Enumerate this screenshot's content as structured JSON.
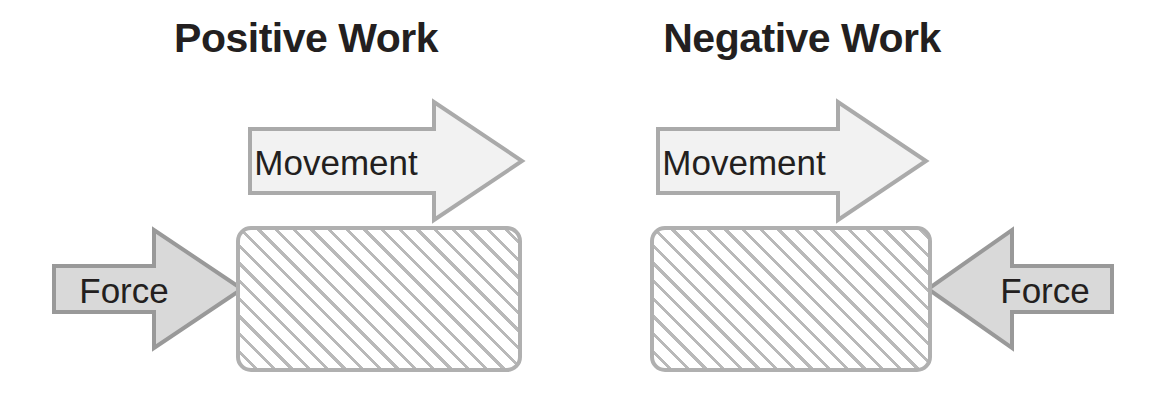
{
  "diagram": {
    "title_semantic": "positive-vs-negative-work",
    "background_color": "#ffffff",
    "panels": [
      {
        "id": "positive",
        "title": "Positive Work",
        "title_color": "#231f20",
        "movement_arrow": {
          "label": "Movement",
          "direction": "right",
          "fill": "#f2f2f2",
          "stroke": "#aaaaaa"
        },
        "force_arrow": {
          "label": "Force",
          "direction": "right",
          "fill": "#d9d9d9",
          "stroke": "#999999"
        },
        "block": {
          "fill": "#ffffff",
          "hatch_color": "#b9b9b9",
          "stroke": "#b0b0b0"
        }
      },
      {
        "id": "negative",
        "title": "Negative Work",
        "title_color": "#231f20",
        "movement_arrow": {
          "label": "Movement",
          "direction": "right",
          "fill": "#f2f2f2",
          "stroke": "#aaaaaa"
        },
        "force_arrow": {
          "label": "Force",
          "direction": "left",
          "fill": "#d9d9d9",
          "stroke": "#999999"
        },
        "block": {
          "fill": "#ffffff",
          "hatch_color": "#b9b9b9",
          "stroke": "#b0b0b0"
        }
      }
    ]
  }
}
